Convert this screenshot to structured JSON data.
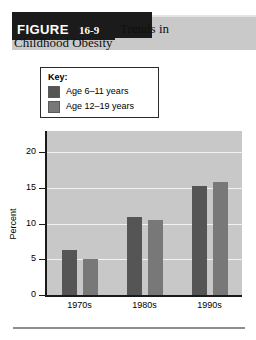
{
  "header": {
    "badge_word": "FIGURE",
    "badge_number": "16-9",
    "title_line1": "Trends in",
    "title_line2": "Childhood Obesity"
  },
  "legend": {
    "title": "Key:",
    "items": [
      {
        "label": "Age 6–11 years",
        "color": "#555555"
      },
      {
        "label": "Age 12–19 years",
        "color": "#787878"
      }
    ]
  },
  "colors": {
    "plot_background": "#c8c8c8",
    "gridline": "#f2f2f2",
    "axis": "#1a1a1a",
    "series_1": "#555555",
    "series_2": "#787878",
    "banner": "#c9c9c9",
    "badge": "#1b1b1b",
    "footer_rule": "#8d8d8d"
  },
  "chart_data": {
    "type": "bar",
    "title": "Trends in Childhood Obesity",
    "xlabel": "",
    "ylabel": "Percent",
    "categories": [
      "1970s",
      "1980s",
      "1990s"
    ],
    "series": [
      {
        "name": "Age 6–11 years",
        "values": [
          6.3,
          11.0,
          15.3
        ]
      },
      {
        "name": "Age 12–19 years",
        "values": [
          5.0,
          10.5,
          15.8
        ]
      }
    ],
    "ylim": [
      0,
      23
    ],
    "yticks": [
      0,
      5,
      10,
      15,
      20
    ],
    "ytick_labels": [
      "0",
      "5",
      "10",
      "15",
      "20"
    ],
    "grid": true,
    "legend_position": "above-plot"
  }
}
